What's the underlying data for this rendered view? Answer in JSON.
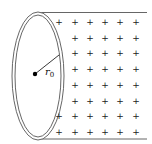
{
  "diagram": {
    "radius_label": "r",
    "radius_subscript": "0",
    "charge_symbol": "+",
    "colors": {
      "stroke": "#555555",
      "plus": "#222222",
      "dot": "#000000",
      "background": "#ffffff"
    },
    "charge_grid": {
      "columns_x": [
        59,
        75,
        90,
        105,
        120,
        136
      ],
      "rows_y": [
        22,
        38,
        53,
        69,
        85,
        101,
        116,
        132
      ],
      "first_column_rows_visible": [
        0,
        6,
        7
      ]
    }
  }
}
